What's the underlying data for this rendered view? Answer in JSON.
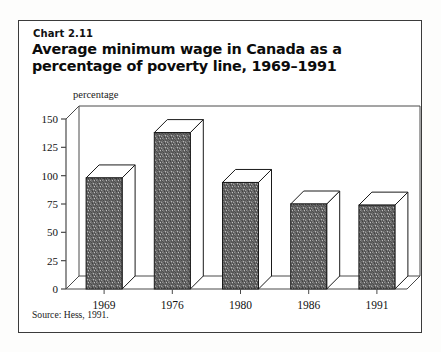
{
  "figure": {
    "chart_number": "Chart 2.11",
    "title": "Average minimum wage in Canada as a percentage of poverty line, 1969–1991",
    "source": "Source: Hess, 1991.",
    "axis_unit_label": "percentage",
    "border_color": "#3b3b3b",
    "background_color": "#ffffff"
  },
  "chart_data": {
    "type": "bar",
    "title": "Average minimum wage in Canada as a percentage of poverty line, 1969–1991",
    "subtitle": "Chart 2.11",
    "categories": [
      "1969",
      "1976",
      "1980",
      "1986",
      "1991"
    ],
    "values": [
      98,
      138,
      94,
      75,
      74
    ],
    "xlabel": "",
    "ylabel": "percentage",
    "ylim": [
      0,
      150
    ],
    "yticks": [
      0,
      25,
      50,
      75,
      100,
      125,
      150
    ],
    "ytick_labels": [
      "0",
      "25",
      "50",
      "75",
      "100",
      "125",
      "150"
    ],
    "grid": false,
    "legend": null,
    "style": "3d-extruded-bars",
    "bar_fill": "#6e6e6e",
    "bar_top_fill": "#ffffff",
    "bar_side_fill": "#ffffff",
    "bar_outline": "#111111",
    "source_note": "Source: Hess, 1991."
  }
}
